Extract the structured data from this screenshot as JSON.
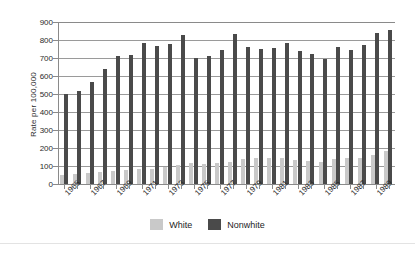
{
  "chart_data": {
    "type": "bar",
    "title": "",
    "subtitle": "",
    "xlabel": "",
    "ylabel": "Rate per 100,000",
    "ylim": [
      0,
      900
    ],
    "ytick_step": 100,
    "yticks": [
      0,
      100,
      200,
      300,
      400,
      500,
      600,
      700,
      800,
      900
    ],
    "ytick_labels": [
      "0",
      "100",
      "200",
      "300",
      "400",
      "500",
      "600",
      "700",
      "800",
      "900"
    ],
    "grid": true,
    "legend_position": "bottom-center",
    "categories": [
      "1965",
      "1966",
      "1967",
      "1968",
      "1969",
      "1970",
      "1971",
      "1972",
      "1973",
      "1974",
      "1975",
      "1976",
      "1977",
      "1978",
      "1979",
      "1980",
      "1981",
      "1982",
      "1983",
      "1984",
      "1985",
      "1986",
      "1987",
      "1988",
      "1989",
      "1990"
    ],
    "xtick_labels": [
      "1965",
      "1967",
      "1969",
      "1971",
      "1973",
      "1975",
      "1977",
      "1979",
      "1981",
      "1983",
      "1985",
      "1987",
      "1989"
    ],
    "series": [
      {
        "name": "White",
        "color": "#c9c9c9",
        "values": [
          50,
          55,
          62,
          65,
          70,
          80,
          82,
          86,
          96,
          106,
          116,
          110,
          118,
          124,
          140,
          142,
          144,
          145,
          133,
          128,
          125,
          138,
          142,
          147,
          160,
          185
        ]
      },
      {
        "name": "Nonwhite",
        "color": "#4a4a4a",
        "values": [
          500,
          518,
          564,
          638,
          712,
          716,
          782,
          764,
          779,
          828,
          700,
          710,
          747,
          833,
          762,
          752,
          754,
          786,
          738,
          722,
          694,
          761,
          744,
          775,
          838,
          853
        ]
      }
    ]
  },
  "legend": {
    "items": [
      {
        "label": "White",
        "color": "#c9c9c9"
      },
      {
        "label": "Nonwhite",
        "color": "#4a4a4a"
      }
    ]
  },
  "axis": {
    "y_title": "Rate per 100,000"
  },
  "colors": {
    "white_bar": "#c9c9c9",
    "nonwhite_bar": "#4a4a4a",
    "gridline": "#9a9a9a",
    "axis": "#8a8a8a",
    "text": "#2b2b2b",
    "background": "#ffffff"
  }
}
